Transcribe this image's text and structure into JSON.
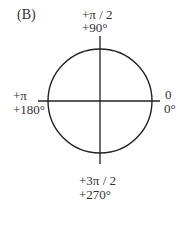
{
  "panel_label": "(B)",
  "angles": {
    "top": {
      "rad": "+π / 2",
      "deg": "+90°"
    },
    "left": {
      "rad": "+π",
      "deg": "+180°"
    },
    "right": {
      "rad": "0",
      "deg": "0°"
    },
    "bottom": {
      "rad": "+3π / 2",
      "deg": "+270°"
    }
  },
  "colors": {
    "stroke": "#222222",
    "text": "#333333"
  }
}
